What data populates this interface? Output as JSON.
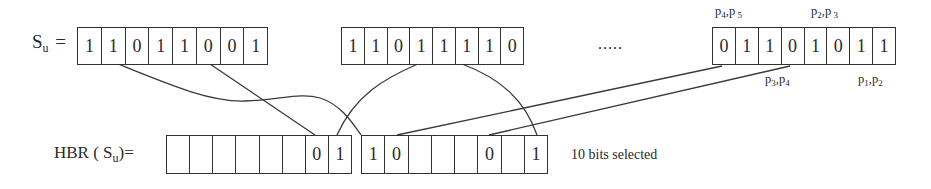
{
  "labels": {
    "su_symbol": "S",
    "su_sub": "u",
    "su_eq": "=",
    "hbr_prefix": "HBR ( S",
    "hbr_sub": "u",
    "hbr_suffix": ")=",
    "ellipsis": ".....",
    "bits_selected": "10 bits selected"
  },
  "registers": {
    "su_1": [
      "1",
      "1",
      "0",
      "1",
      "1",
      "0",
      "0",
      "1"
    ],
    "su_2": [
      "1",
      "1",
      "0",
      "1",
      "1",
      "1",
      "1",
      "0"
    ],
    "su_3": [
      "0",
      "1",
      "1",
      "0",
      "1",
      "0",
      "1",
      "1"
    ],
    "hbr_left": [
      "",
      "",
      "",
      "",
      "",
      "",
      "0",
      "1"
    ],
    "hbr_right": [
      "1",
      "0",
      "",
      "",
      "",
      "0",
      "",
      "1"
    ]
  },
  "annotations": {
    "top_left": {
      "a": "p",
      "a_sub": "4",
      "sep": ",",
      "b": "p",
      "b_sub": " 5"
    },
    "top_right": {
      "a": "p",
      "a_sub": "2",
      "sep": ",",
      "b": "p",
      "b_sub": " 3"
    },
    "bottom_left": {
      "a": "p",
      "a_sub": "3",
      "sep": ",",
      "b": "p",
      "b_sub": "4"
    },
    "bottom_right": {
      "a": "p",
      "a_sub": "1",
      "sep": ",",
      "b": "p",
      "b_sub": "2"
    }
  },
  "colors": {
    "line": "#333333",
    "text": "#2a2a2a",
    "background": "#ffffff"
  }
}
